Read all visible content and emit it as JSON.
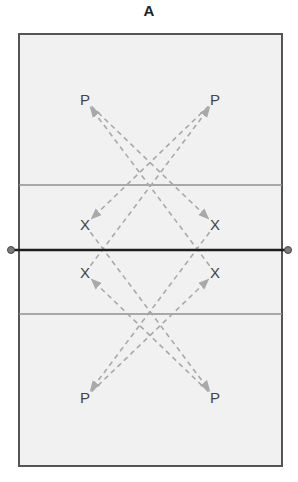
{
  "diagram": {
    "title": "A",
    "court": {
      "x": 19,
      "y": 34,
      "width": 263,
      "height": 432,
      "fill": "#f1f1f1",
      "border_color": "#555555",
      "attack_line_top_y": 185,
      "attack_line_bottom_y": 314,
      "attack_line_color": "#8f8f8f",
      "net_y": 250,
      "net_color": "#1e1e1e",
      "net_post_color": "#7a7a7a"
    },
    "markers": [
      {
        "id": "p-top-left",
        "label": "P",
        "x": 85,
        "y": 100
      },
      {
        "id": "p-top-right",
        "label": "P",
        "x": 215,
        "y": 100
      },
      {
        "id": "x-upper-left",
        "label": "X",
        "x": 85,
        "y": 225
      },
      {
        "id": "x-upper-right",
        "label": "X",
        "x": 215,
        "y": 225
      },
      {
        "id": "x-lower-left",
        "label": "X",
        "x": 85,
        "y": 273
      },
      {
        "id": "x-lower-right",
        "label": "X",
        "x": 215,
        "y": 273
      },
      {
        "id": "p-bottom-left",
        "label": "P",
        "x": 85,
        "y": 398
      },
      {
        "id": "p-bottom-right",
        "label": "P",
        "x": 215,
        "y": 398
      }
    ],
    "paths": [
      {
        "from": "p-top-left",
        "to": "x-upper-right"
      },
      {
        "from": "p-top-right",
        "to": "x-upper-left"
      },
      {
        "from": "x-upper-left",
        "to": "p-bottom-right"
      },
      {
        "from": "x-upper-right",
        "to": "p-bottom-left"
      },
      {
        "from": "x-lower-left",
        "to": "p-top-right"
      },
      {
        "from": "x-lower-right",
        "to": "p-top-left"
      },
      {
        "from": "p-bottom-left",
        "to": "x-lower-right"
      },
      {
        "from": "p-bottom-right",
        "to": "x-lower-left"
      }
    ],
    "path_style": {
      "color": "#a9a9a9",
      "dash": "5,4",
      "arrow": "end"
    }
  }
}
